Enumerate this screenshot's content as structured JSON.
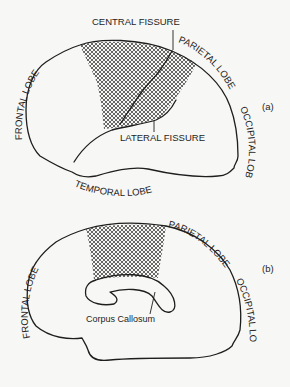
{
  "figure_a": {
    "panel_label": "(a)",
    "labels": {
      "central_fissure": "CENTRAL FISSURE",
      "lateral_fissure": "LATERAL FISSURE",
      "frontal_lobe": "FRONTAL LOBE",
      "parietal_lobe": "PARIETAL LOBE",
      "occipital_lobe": "OCCIPITAL LOBE",
      "temporal_lobe": "TEMPORAL LOBE"
    }
  },
  "figure_b": {
    "panel_label": "(b)",
    "labels": {
      "frontal_lobe": "FRONTAL LOBE",
      "parietal_lobe": "PARIETAL LOBE",
      "occipital_lobe": "OCCIPITAL LOBE",
      "corpus_callosum": "Corpus Callosum"
    }
  },
  "colors": {
    "ink": "#1e1e1e",
    "paper": "#f7f7f5"
  }
}
